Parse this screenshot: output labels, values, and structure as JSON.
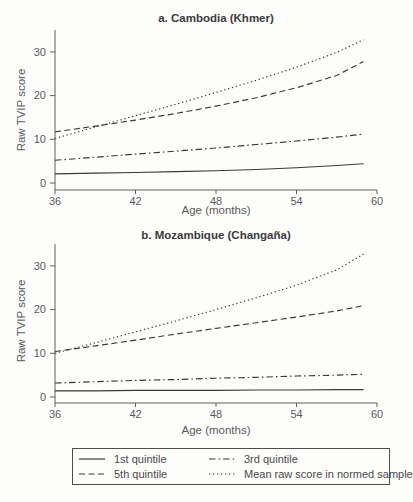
{
  "colors": {
    "background": "#fdfdfb",
    "line": "#3a3a3a",
    "title_text": "#3b3b3b",
    "axis_text": "#5b5b5b",
    "legend_text": "#4a4a4a",
    "legend_border": "#4e4e4e"
  },
  "legend": {
    "items": [
      {
        "label": "1st quintile",
        "style": "solid"
      },
      {
        "label": "3rd quintile",
        "style": "dashdot"
      },
      {
        "label": "5th quintile",
        "style": "dashed"
      },
      {
        "label": "Mean raw score in normed sample",
        "style": "dotted"
      }
    ]
  },
  "chart_data": [
    {
      "type": "line",
      "title": "a. Cambodia (Khmer)",
      "xlabel": "Age (months)",
      "ylabel": "Raw TVIP score",
      "xlim": [
        36,
        60
      ],
      "ylim": [
        0,
        33
      ],
      "xticks": [
        36,
        42,
        48,
        54,
        60
      ],
      "yticks": [
        0,
        10,
        20,
        30
      ],
      "grid": false,
      "x": [
        36,
        39,
        42,
        45,
        48,
        51,
        54,
        57,
        59
      ],
      "series": [
        {
          "name": "1st quintile",
          "style": "solid",
          "values": [
            2.1,
            2.25,
            2.4,
            2.6,
            2.8,
            3.1,
            3.5,
            4.0,
            4.4
          ]
        },
        {
          "name": "3rd quintile",
          "style": "dashdot",
          "values": [
            5.2,
            5.9,
            6.6,
            7.3,
            8.0,
            8.8,
            9.6,
            10.5,
            11.2
          ]
        },
        {
          "name": "5th quintile",
          "style": "dashed",
          "values": [
            11.7,
            13.0,
            14.4,
            15.9,
            17.6,
            19.5,
            21.8,
            24.6,
            27.8
          ]
        },
        {
          "name": "Mean raw score in normed sample",
          "style": "dotted",
          "values": [
            10.2,
            12.8,
            15.4,
            18.0,
            20.7,
            23.5,
            26.5,
            29.9,
            32.8
          ]
        }
      ]
    },
    {
      "type": "line",
      "title": "b. Mozambique (Changaña)",
      "xlabel": "Age (months)",
      "ylabel": "Raw TVIP score",
      "xlim": [
        36,
        60
      ],
      "ylim": [
        0,
        33
      ],
      "xticks": [
        36,
        42,
        48,
        54,
        60
      ],
      "yticks": [
        0,
        10,
        20,
        30
      ],
      "grid": false,
      "x": [
        36,
        39,
        42,
        45,
        48,
        51,
        54,
        57,
        59
      ],
      "series": [
        {
          "name": "1st quintile",
          "style": "solid",
          "values": [
            1.4,
            1.4,
            1.5,
            1.5,
            1.5,
            1.6,
            1.6,
            1.7,
            1.7
          ]
        },
        {
          "name": "3rd quintile",
          "style": "dashdot",
          "values": [
            3.2,
            3.5,
            3.8,
            4.0,
            4.3,
            4.5,
            4.8,
            5.0,
            5.2
          ]
        },
        {
          "name": "5th quintile",
          "style": "dashed",
          "values": [
            10.4,
            11.7,
            13.0,
            14.4,
            15.7,
            17.0,
            18.3,
            19.7,
            20.9
          ]
        },
        {
          "name": "Mean raw score in normed sample",
          "style": "dotted",
          "values": [
            10.0,
            12.4,
            14.9,
            17.4,
            20.0,
            22.7,
            25.6,
            29.1,
            32.7
          ]
        }
      ]
    }
  ]
}
